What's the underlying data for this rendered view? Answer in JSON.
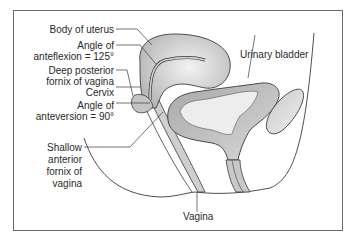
{
  "figure": {
    "type": "anatomical-diagram"
  },
  "labels": {
    "body_of_uterus": "Body of uterus",
    "angle_of_anteflexion_1": "Angle of",
    "angle_of_anteflexion_2": "anteflexion = 125°",
    "deep_posterior_fornix_1": "Deep posterior",
    "deep_posterior_fornix_2": "fornix of vagina",
    "cervix": "Cervix",
    "angle_of_anteversion_1": "Angle of",
    "angle_of_anteversion_2": "anteversion = 90°",
    "shallow_anterior_fornix_1": "Shallow",
    "shallow_anterior_fornix_2": "anterior",
    "shallow_anterior_fornix_3": "fornix of",
    "shallow_anterior_fornix_4": "vagina",
    "urinary_bladder": "Urinary bladder",
    "vagina": "Vagina"
  },
  "colors": {
    "frame": "#6b6b6b",
    "outline": "#3a3a3a",
    "tissue_light": "#e6e6e6",
    "tissue_mid": "#bdbdbd",
    "tissue_dark": "#9a9a9a"
  }
}
